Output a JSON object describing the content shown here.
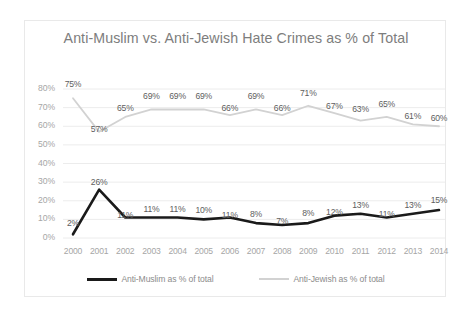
{
  "chart_data": {
    "type": "line",
    "title": "Anti-Muslim vs. Anti-Jewish Hate Crimes as % of Total",
    "xlabel": "",
    "ylabel": "",
    "categories": [
      "2000",
      "2001",
      "2002",
      "2003",
      "2004",
      "2005",
      "2006",
      "2007",
      "2008",
      "2009",
      "2010",
      "2011",
      "2012",
      "2013",
      "2014"
    ],
    "ylim": [
      0,
      80
    ],
    "ytick_labels": [
      "80%",
      "70%",
      "60%",
      "50%",
      "40%",
      "30%",
      "20%",
      "10%",
      "0%"
    ],
    "ytick_values": [
      80,
      70,
      60,
      50,
      40,
      30,
      20,
      10,
      0
    ],
    "grid": true,
    "legend_position": "bottom",
    "series": [
      {
        "name": "Anti-Muslim as % of total",
        "color": "#1a1a1a",
        "values": [
          2,
          26,
          11,
          11,
          11,
          10,
          11,
          8,
          7,
          8,
          12,
          13,
          11,
          13,
          15
        ],
        "labels": [
          "2%",
          "26%",
          "11%",
          "11%",
          "11%",
          "10%",
          "11%",
          "8%",
          "7%",
          "8%",
          "12%",
          "13%",
          "11%",
          "13%",
          "15%"
        ]
      },
      {
        "name": "Anti-Jewish as % of total",
        "color": "#d2d2d2",
        "values": [
          75,
          57,
          65,
          69,
          69,
          69,
          66,
          69,
          66,
          71,
          67,
          63,
          65,
          61,
          60
        ],
        "labels": [
          "75%",
          "57%",
          "65%",
          "69%",
          "69%",
          "69%",
          "66%",
          "69%",
          "66%",
          "71%",
          "67%",
          "63%",
          "65%",
          "61%",
          "60%"
        ]
      }
    ]
  },
  "legend": {
    "items": [
      {
        "label": "Anti-Muslim as % of total"
      },
      {
        "label": "Anti-Jewish as % of total"
      }
    ]
  }
}
